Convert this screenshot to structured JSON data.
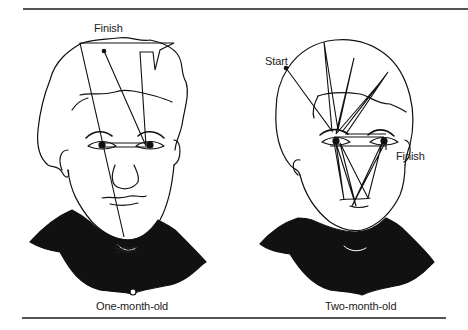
{
  "figure": {
    "panels": [
      {
        "caption": "One-month-old",
        "start_label": "Start",
        "finish_label": "Finish"
      },
      {
        "caption": "Two-month-old",
        "start_label": "Start",
        "finish_label": "Finish"
      }
    ],
    "colors": {
      "ink": "#111111",
      "rule": "#555555",
      "background": "#ffffff"
    }
  }
}
